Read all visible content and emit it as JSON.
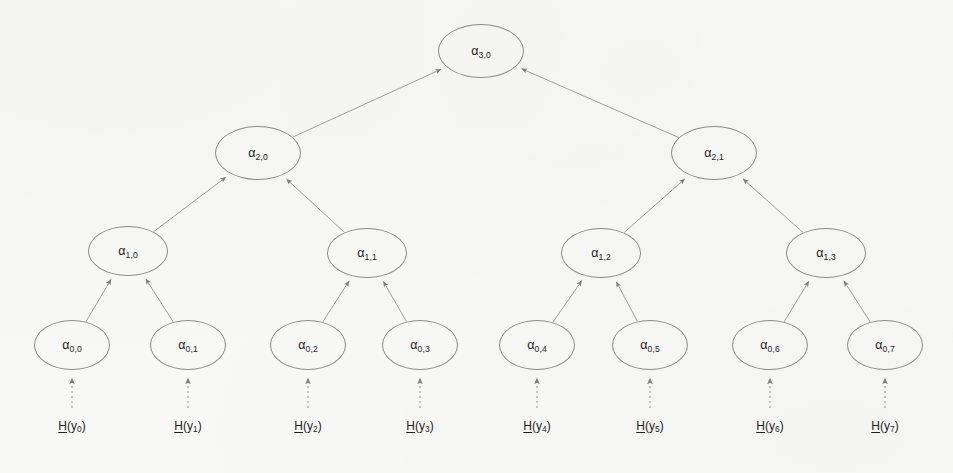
{
  "diagram": {
    "type": "binary-hash-tree",
    "background_color": "#f8f8f6",
    "node_stroke_color": "#8d8d8d",
    "edge_color": "#9a9a9a",
    "text_color": "#1d1d1d",
    "levels": 4,
    "leaf_count": 8
  },
  "nodes": [
    {
      "id": "a30",
      "base": "α",
      "sub": "3,0",
      "level": 3,
      "index": 0,
      "cx": 481,
      "cy": 51,
      "rx": 43,
      "ry": 27
    },
    {
      "id": "a20",
      "base": "α",
      "sub": "2,0",
      "level": 2,
      "index": 0,
      "cx": 258,
      "cy": 153,
      "rx": 43,
      "ry": 27
    },
    {
      "id": "a21",
      "base": "α",
      "sub": "2,1",
      "level": 2,
      "index": 1,
      "cx": 714,
      "cy": 153,
      "rx": 43,
      "ry": 27
    },
    {
      "id": "a10",
      "base": "α",
      "sub": "1,0",
      "level": 1,
      "index": 0,
      "cx": 128,
      "cy": 251,
      "rx": 40,
      "ry": 25
    },
    {
      "id": "a11",
      "base": "α",
      "sub": "1,1",
      "level": 1,
      "index": 1,
      "cx": 367,
      "cy": 253,
      "rx": 40,
      "ry": 25
    },
    {
      "id": "a12",
      "base": "α",
      "sub": "1,2",
      "level": 1,
      "index": 2,
      "cx": 601,
      "cy": 253,
      "rx": 40,
      "ry": 25
    },
    {
      "id": "a13",
      "base": "α",
      "sub": "1,3",
      "level": 1,
      "index": 3,
      "cx": 826,
      "cy": 253,
      "rx": 40,
      "ry": 25
    },
    {
      "id": "a00",
      "base": "α",
      "sub": "0,0",
      "level": 0,
      "index": 0,
      "cx": 72,
      "cy": 345,
      "rx": 38,
      "ry": 25
    },
    {
      "id": "a01",
      "base": "α",
      "sub": "0,1",
      "level": 0,
      "index": 1,
      "cx": 188,
      "cy": 345,
      "rx": 38,
      "ry": 25
    },
    {
      "id": "a02",
      "base": "α",
      "sub": "0,2",
      "level": 0,
      "index": 2,
      "cx": 308,
      "cy": 345,
      "rx": 38,
      "ry": 25
    },
    {
      "id": "a03",
      "base": "α",
      "sub": "0,3",
      "level": 0,
      "index": 3,
      "cx": 420,
      "cy": 345,
      "rx": 38,
      "ry": 25
    },
    {
      "id": "a04",
      "base": "α",
      "sub": "0,4",
      "level": 0,
      "index": 4,
      "cx": 537,
      "cy": 345,
      "rx": 38,
      "ry": 25
    },
    {
      "id": "a05",
      "base": "α",
      "sub": "0,5",
      "level": 0,
      "index": 5,
      "cx": 650,
      "cy": 345,
      "rx": 38,
      "ry": 25
    },
    {
      "id": "a06",
      "base": "α",
      "sub": "0,6",
      "level": 0,
      "index": 6,
      "cx": 770,
      "cy": 345,
      "rx": 38,
      "ry": 25
    },
    {
      "id": "a07",
      "base": "α",
      "sub": "0,7",
      "level": 0,
      "index": 7,
      "cx": 885,
      "cy": 345,
      "rx": 38,
      "ry": 25
    }
  ],
  "edges": [
    {
      "from": "a20",
      "to": "a30"
    },
    {
      "from": "a21",
      "to": "a30"
    },
    {
      "from": "a10",
      "to": "a20"
    },
    {
      "from": "a11",
      "to": "a20"
    },
    {
      "from": "a12",
      "to": "a21"
    },
    {
      "from": "a13",
      "to": "a21"
    },
    {
      "from": "a00",
      "to": "a10"
    },
    {
      "from": "a01",
      "to": "a10"
    },
    {
      "from": "a02",
      "to": "a11"
    },
    {
      "from": "a03",
      "to": "a11"
    },
    {
      "from": "a04",
      "to": "a12"
    },
    {
      "from": "a05",
      "to": "a12"
    },
    {
      "from": "a06",
      "to": "a13"
    },
    {
      "from": "a07",
      "to": "a13"
    }
  ],
  "leaf_inputs": [
    {
      "id": "hy0",
      "prefix": "H",
      "open": "(y",
      "sub": "0",
      "close": ")",
      "x": 72,
      "y": 428,
      "target": "a00"
    },
    {
      "id": "hy1",
      "prefix": "H",
      "open": "(y",
      "sub": "1",
      "close": ")",
      "x": 188,
      "y": 428,
      "target": "a01"
    },
    {
      "id": "hy2",
      "prefix": "H",
      "open": "(y",
      "sub": "2",
      "close": ")",
      "x": 308,
      "y": 428,
      "target": "a02"
    },
    {
      "id": "hy3",
      "prefix": "H",
      "open": "(y",
      "sub": "3",
      "close": ")",
      "x": 420,
      "y": 428,
      "target": "a03"
    },
    {
      "id": "hy4",
      "prefix": "H",
      "open": "(y",
      "sub": "4",
      "close": ")",
      "x": 537,
      "y": 428,
      "target": "a04"
    },
    {
      "id": "hy5",
      "prefix": "H",
      "open": "(y",
      "sub": "5",
      "close": ")",
      "x": 650,
      "y": 428,
      "target": "a05"
    },
    {
      "id": "hy6",
      "prefix": "H",
      "open": "(y",
      "sub": "6",
      "close": ")",
      "x": 770,
      "y": 428,
      "target": "a06"
    },
    {
      "id": "hy7",
      "prefix": "H",
      "open": "(y",
      "sub": "7",
      "close": ")",
      "x": 885,
      "y": 428,
      "target": "a07"
    }
  ]
}
